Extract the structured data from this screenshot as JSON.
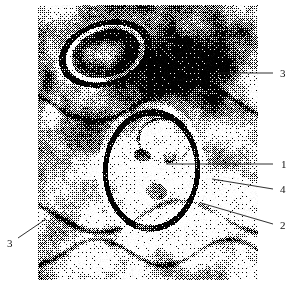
{
  "figure": {
    "type": "micrograph",
    "background_color": "#ffffff",
    "image_area": {
      "x": 38,
      "y": 5,
      "width": 220,
      "height": 275
    },
    "image_tone": {
      "dark": "#111111",
      "mid": "#8a8a8a",
      "light": "#f2f2f2"
    }
  },
  "callouts": [
    {
      "id": "callout-3-top",
      "label": "3",
      "label_x": 280,
      "label_y": 68,
      "line": {
        "x1": 218,
        "y1": 73,
        "x2": 273,
        "y2": 73
      }
    },
    {
      "id": "callout-1",
      "label": "1",
      "label_x": 281,
      "label_y": 159,
      "line": {
        "x1": 166,
        "y1": 164,
        "x2": 273,
        "y2": 164
      }
    },
    {
      "id": "callout-4",
      "label": "4",
      "label_x": 280,
      "label_y": 184,
      "line": {
        "x1": 212,
        "y1": 179,
        "x2": 273,
        "y2": 189
      }
    },
    {
      "id": "callout-2",
      "label": "2",
      "label_x": 280,
      "label_y": 220,
      "line": {
        "x1": 201,
        "y1": 203,
        "x2": 273,
        "y2": 224
      }
    },
    {
      "id": "callout-3-bottom",
      "label": "3",
      "label_x": 7,
      "label_y": 238,
      "line": {
        "x1": 18,
        "y1": 238,
        "x2": 46,
        "y2": 219
      }
    }
  ]
}
